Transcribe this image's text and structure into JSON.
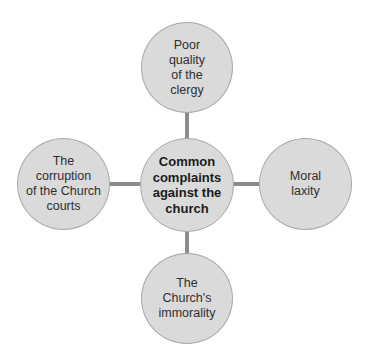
{
  "diagram": {
    "type": "mind-map",
    "center": {
      "label_lines": [
        "Common",
        "complaints",
        "against the",
        "church"
      ]
    },
    "nodes": [
      {
        "position": "top",
        "label_lines": [
          "Poor",
          "quality",
          "of the",
          "clergy"
        ]
      },
      {
        "position": "right",
        "label_lines": [
          "Moral",
          "laxity"
        ]
      },
      {
        "position": "bottom",
        "label_lines": [
          "The",
          "Church's",
          "immorality"
        ]
      },
      {
        "position": "left",
        "label_lines": [
          "The",
          "corruption",
          "of the Church",
          "courts"
        ]
      }
    ],
    "colors": {
      "node_fill": "#dadada",
      "node_stroke": "#a9a9a9",
      "connector": "#8c8c8c"
    }
  }
}
